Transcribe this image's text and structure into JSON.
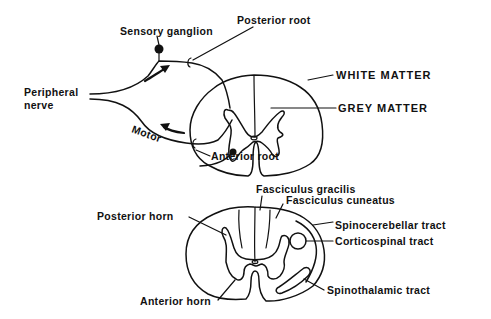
{
  "figure": {
    "top_panel": {
      "labels": {
        "sensory_ganglion": "Sensory ganglion",
        "posterior_root": "Posterior root",
        "peripheral_nerve_line1": "Peripheral",
        "peripheral_nerve_line2": "nerve",
        "motor": "Motor",
        "anterior_root": "Anterior root",
        "white_matter": "WHITE MATTER",
        "grey_matter": "GREY MATTER"
      },
      "arrows": [
        "sensory-arrow-inward",
        "motor-arrow-outward"
      ]
    },
    "bottom_panel": {
      "labels": {
        "fasciculus_gracilis": "Fasciculus gracilis",
        "fasciculus_cuneatus": "Fasciculus cuneatus",
        "posterior_horn": "Posterior horn",
        "spinocerebellar_tract": "Spinocerebellar tract",
        "corticospinal_tract": "Corticospinal tract",
        "spinothalamic_tract": "Spinothalamic tract",
        "anterior_horn": "Anterior horn"
      }
    },
    "colors": {
      "ink": "#111111",
      "background": "#ffffff"
    }
  }
}
